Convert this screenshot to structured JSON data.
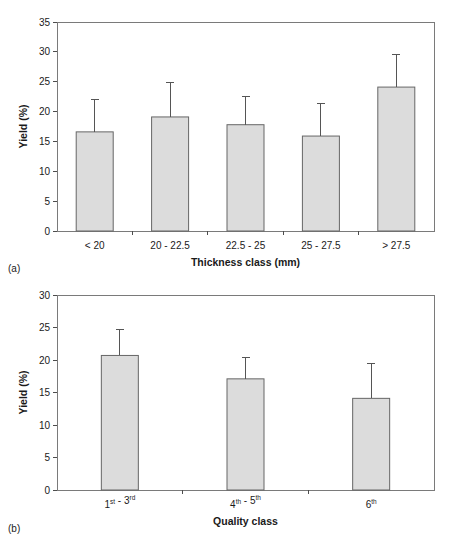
{
  "figure": {
    "panel_a_tag": "(a)",
    "panel_b_tag": "(b)"
  },
  "chart_data": [
    {
      "type": "bar",
      "panel": "(a)",
      "title": "",
      "xlabel": "Thickness class (mm)",
      "ylabel": "Yield (%)",
      "categories": [
        "< 20",
        "20 - 22.5",
        "22.5 - 25",
        "25 - 27.5",
        "> 27.5"
      ],
      "values": [
        16.6,
        19.1,
        17.8,
        15.9,
        24.1
      ],
      "errors_upper": [
        22.1,
        24.8,
        22.5,
        21.4,
        29.5
      ],
      "error_direction": "upper-only",
      "ylim": [
        0,
        35
      ],
      "yticks": [
        0,
        5,
        10,
        15,
        20,
        25,
        30,
        35
      ],
      "ytick_labels": [
        "0",
        "5",
        "10",
        "15",
        "20",
        "25",
        "30",
        "35"
      ],
      "grid": false,
      "legend": "none",
      "bar_fill": "#dcdcdc",
      "bar_stroke": "#666666"
    },
    {
      "type": "bar",
      "panel": "(b)",
      "title": "",
      "xlabel": "Quality class",
      "ylabel": "Yield (%)",
      "categories": [
        "1st - 3rd",
        "4th - 5th",
        "6th"
      ],
      "category_parts": [
        [
          {
            "base": "1",
            "sup": "st"
          },
          {
            "base": " - "
          },
          {
            "base": "3",
            "sup": "rd"
          }
        ],
        [
          {
            "base": "4",
            "sup": "th"
          },
          {
            "base": " - "
          },
          {
            "base": "5",
            "sup": "th"
          }
        ],
        [
          {
            "base": "6",
            "sup": "th"
          }
        ]
      ],
      "values": [
        20.7,
        17.1,
        14.1
      ],
      "errors_upper": [
        24.7,
        20.4,
        19.4
      ],
      "error_direction": "upper-only",
      "ylim": [
        0,
        30
      ],
      "yticks": [
        0,
        5,
        10,
        15,
        20,
        25,
        30
      ],
      "ytick_labels": [
        "0",
        "5",
        "10",
        "15",
        "20",
        "25",
        "30"
      ],
      "grid": false,
      "legend": "none",
      "bar_fill": "#dcdcdc",
      "bar_stroke": "#666666"
    }
  ]
}
